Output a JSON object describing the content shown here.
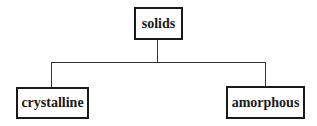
{
  "diagram": {
    "type": "tree",
    "root": {
      "label": "solids"
    },
    "children": [
      {
        "label": "crystalline"
      },
      {
        "label": "amorphous"
      }
    ]
  }
}
